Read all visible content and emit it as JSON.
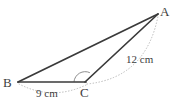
{
  "figure": {
    "kind": "geometry-diagram",
    "shape": "triangle",
    "background_color": "#ffffff",
    "stroke_color": "#3a3a3a",
    "guide_color": "#b9b9b9",
    "label_color": "#3d3d3d",
    "vertices": [
      {
        "name": "A",
        "label": "A",
        "x": 158,
        "y": 14
      },
      {
        "name": "B",
        "label": "B",
        "x": 18,
        "y": 82
      },
      {
        "name": "C",
        "label": "C",
        "x": 85,
        "y": 82
      }
    ],
    "sides": [
      {
        "name": "side-ba",
        "from": "B",
        "to": "A",
        "style": "solid"
      },
      {
        "name": "side-bc",
        "from": "B",
        "to": "C",
        "style": "solid"
      },
      {
        "name": "side-ca",
        "from": "C",
        "to": "A",
        "style": "solid"
      }
    ],
    "angle_marks": [
      {
        "name": "angle-at-c",
        "at": "C",
        "type": "arc",
        "label": ""
      }
    ],
    "measurements": [
      {
        "name": "measure-bc",
        "label": "9 cm",
        "value": 9,
        "unit": "cm",
        "side": "BC"
      },
      {
        "name": "measure-ca",
        "label": "12 cm",
        "value": 12,
        "unit": "cm",
        "side": "CA"
      }
    ],
    "guides": [
      {
        "name": "guide-arc-bc",
        "style": "dotted",
        "from": "B",
        "to": "C"
      },
      {
        "name": "guide-arc-ca",
        "style": "dotted",
        "from": "C",
        "to": "A"
      }
    ]
  }
}
